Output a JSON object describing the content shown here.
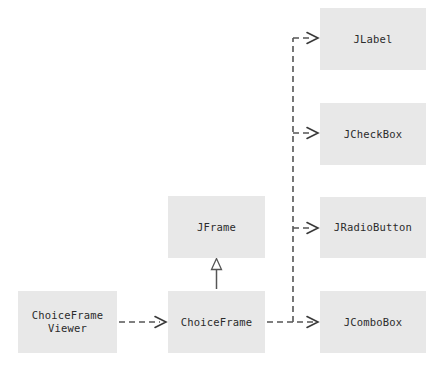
{
  "diagram": {
    "kind": "uml-class-diagram",
    "background_color": "#ffffff",
    "box_fill_color": "#e8e8e8",
    "text_color": "#2b2b2b",
    "edge_color": "#555555",
    "classes": [
      {
        "id": "jlabel",
        "label": "JLabel"
      },
      {
        "id": "jcheckbox",
        "label": "JCheckBox"
      },
      {
        "id": "jradiobutton",
        "label": "JRadioButton"
      },
      {
        "id": "jcombobox",
        "label": "JComboBox"
      },
      {
        "id": "jframe",
        "label": "JFrame"
      },
      {
        "id": "choiceframe",
        "label": "ChoiceFrame"
      },
      {
        "id": "choiceframeviewer",
        "label": "ChoiceFrame\nViewer"
      }
    ],
    "relationships": [
      {
        "id": "inheritance-choiceframe-jframe",
        "from": "ChoiceFrame",
        "to": "JFrame",
        "type": "inheritance",
        "line": "solid",
        "arrowhead": "hollow-triangle"
      },
      {
        "id": "dependency-viewer-choiceframe",
        "from": "ChoiceFrameViewer",
        "to": "ChoiceFrame",
        "type": "dependency",
        "line": "dashed",
        "arrowhead": "open-v"
      },
      {
        "id": "dependency-choiceframe-jcombobox",
        "from": "ChoiceFrame",
        "to": "JComboBox",
        "type": "dependency",
        "line": "dashed",
        "arrowhead": "open-v"
      },
      {
        "id": "dependency-choiceframe-jlabel",
        "from": "ChoiceFrame",
        "to": "JLabel",
        "type": "dependency",
        "line": "dashed",
        "arrowhead": "open-v"
      },
      {
        "id": "dependency-choiceframe-jcheckbox",
        "from": "ChoiceFrame",
        "to": "JCheckBox",
        "type": "dependency",
        "line": "dashed",
        "arrowhead": "open-v"
      },
      {
        "id": "dependency-choiceframe-jradiobutton",
        "from": "ChoiceFrame",
        "to": "JRadioButton",
        "type": "dependency",
        "line": "dashed",
        "arrowhead": "open-v"
      }
    ]
  }
}
